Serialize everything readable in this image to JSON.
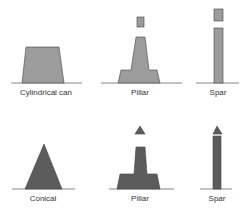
{
  "diagram": {
    "colors": {
      "top_fill": "#9c9c9c",
      "bottom_fill": "#5c5c5c",
      "stroke": "#444444",
      "baseline": "#666666"
    },
    "top_row": [
      {
        "label": "Cylindrical can",
        "label_x": 46,
        "label_y": 88
      },
      {
        "label": "Pillar",
        "label_x": 140,
        "label_y": 88
      },
      {
        "label": "Spar",
        "label_x": 218,
        "label_y": 88
      }
    ],
    "bottom_row": [
      {
        "label": "Conical",
        "label_x": 43,
        "label_y": 194
      },
      {
        "label": "Pillar",
        "label_x": 140,
        "label_y": 194
      },
      {
        "label": "Spar",
        "label_x": 217,
        "label_y": 194
      }
    ]
  }
}
